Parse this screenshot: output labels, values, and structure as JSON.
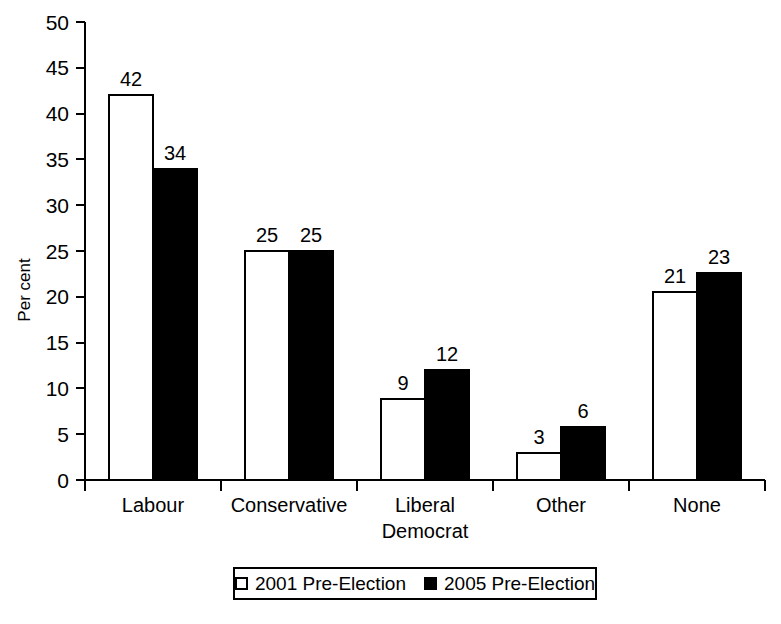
{
  "chart_data": {
    "type": "bar",
    "title": "",
    "subtitle": "",
    "xlabel": "",
    "ylabel": "Per cent",
    "ylim": [
      0,
      50
    ],
    "ytick_step": 5,
    "yticks": [
      "0",
      "5",
      "10",
      "15",
      "20",
      "25",
      "30",
      "35",
      "40",
      "45",
      "50"
    ],
    "grid": false,
    "legend_position": "bottom",
    "categories": [
      "Labour",
      "Conservative",
      "Liberal Democrat",
      "Other",
      "None"
    ],
    "category_lines": [
      [
        "Labour"
      ],
      [
        "Conservative"
      ],
      [
        "Liberal",
        "Democrat"
      ],
      [
        "Other"
      ],
      [
        "None"
      ]
    ],
    "series": [
      {
        "name": "2001 Pre-Election",
        "style": "open",
        "color": "#ffffff",
        "edge_color": "#000000",
        "values": [
          42,
          25,
          9,
          3,
          21
        ],
        "plotted_values": [
          42,
          25,
          8.8,
          2.9,
          20.5
        ],
        "labels": [
          "42",
          "25",
          "9",
          "3",
          "21"
        ]
      },
      {
        "name": "2005 Pre-Election",
        "style": "filled",
        "color": "#000000",
        "edge_color": "#000000",
        "values": [
          34,
          25,
          12,
          6,
          23
        ],
        "plotted_values": [
          34,
          25,
          12,
          5.8,
          22.6
        ],
        "labels": [
          "34",
          "25",
          "12",
          "6",
          "23"
        ]
      }
    ]
  },
  "legend": {
    "entries": [
      {
        "label": "2001 Pre-Election",
        "style": "open"
      },
      {
        "label": "2005 Pre-Election",
        "style": "filled"
      }
    ]
  }
}
